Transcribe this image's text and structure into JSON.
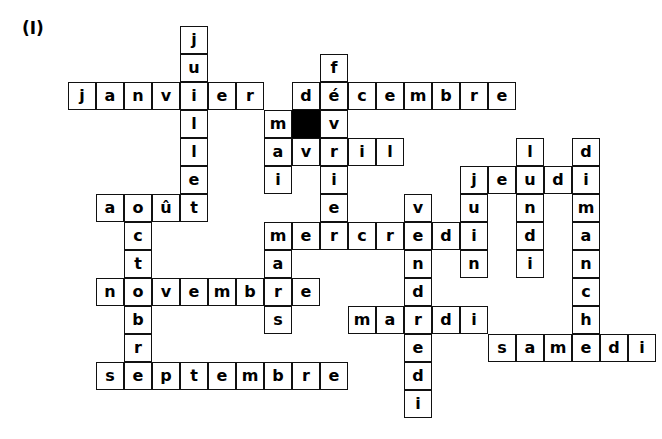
{
  "figure": {
    "label": "(I)"
  },
  "grid": {
    "cell_size": 28,
    "origin_x": 68,
    "origin_y": 26,
    "border_color": "#111111",
    "cell_fill": "#ffffff",
    "blocked_fill": "#000000",
    "text_color": "#000000",
    "columns": 20,
    "rows": 14
  },
  "entries": [
    {
      "word": "juillet",
      "direction": "down",
      "col": 4,
      "row": 0
    },
    {
      "word": "janvier",
      "direction": "across",
      "col": 0,
      "row": 2
    },
    {
      "word": "fevrier",
      "direction": "down",
      "col": 9,
      "row": 1
    },
    {
      "word": "decembre",
      "direction": "across",
      "col": 8,
      "row": 2
    },
    {
      "word": "mai",
      "direction": "down",
      "col": 7,
      "row": 3
    },
    {
      "word": "avril",
      "direction": "across",
      "col": 7,
      "row": 4
    },
    {
      "word": "aout",
      "direction": "across",
      "col": 1,
      "row": 6
    },
    {
      "word": "octobre",
      "direction": "down",
      "col": 2,
      "row": 6
    },
    {
      "word": "lundi",
      "direction": "down",
      "col": 16,
      "row": 4
    },
    {
      "word": "dimanche",
      "direction": "down",
      "col": 18,
      "row": 4
    },
    {
      "word": "jeudi",
      "direction": "across",
      "col": 14,
      "row": 5
    },
    {
      "word": "juin",
      "direction": "down",
      "col": 14,
      "row": 5
    },
    {
      "word": "vendredi",
      "direction": "down",
      "col": 12,
      "row": 6
    },
    {
      "word": "mercredi",
      "direction": "across",
      "col": 7,
      "row": 8
    },
    {
      "word": "mars",
      "direction": "down",
      "col": 7,
      "row": 8
    },
    {
      "word": "novembre",
      "direction": "across",
      "col": 1,
      "row": 10
    },
    {
      "word": "mardi",
      "direction": "across",
      "col": 10,
      "row": 10
    },
    {
      "word": "samedi",
      "direction": "across",
      "col": 15,
      "row": 11
    },
    {
      "word": "septembre",
      "direction": "across",
      "col": 1,
      "row": 13
    }
  ],
  "cells": [
    {
      "col": 4,
      "row": 0,
      "letter": "j",
      "blocked": false
    },
    {
      "col": 4,
      "row": 1,
      "letter": "u",
      "blocked": false
    },
    {
      "col": 9,
      "row": 1,
      "letter": "f",
      "blocked": false
    },
    {
      "col": 0,
      "row": 2,
      "letter": "j",
      "blocked": false
    },
    {
      "col": 1,
      "row": 2,
      "letter": "a",
      "blocked": false
    },
    {
      "col": 2,
      "row": 2,
      "letter": "n",
      "blocked": false
    },
    {
      "col": 3,
      "row": 2,
      "letter": "v",
      "blocked": false
    },
    {
      "col": 4,
      "row": 2,
      "letter": "i",
      "blocked": false
    },
    {
      "col": 5,
      "row": 2,
      "letter": "e",
      "blocked": false
    },
    {
      "col": 6,
      "row": 2,
      "letter": "r",
      "blocked": false
    },
    {
      "col": 8,
      "row": 2,
      "letter": "d",
      "blocked": false
    },
    {
      "col": 9,
      "row": 2,
      "letter": "é",
      "blocked": false
    },
    {
      "col": 10,
      "row": 2,
      "letter": "c",
      "blocked": false
    },
    {
      "col": 11,
      "row": 2,
      "letter": "e",
      "blocked": false
    },
    {
      "col": 12,
      "row": 2,
      "letter": "m",
      "blocked": false
    },
    {
      "col": 13,
      "row": 2,
      "letter": "b",
      "blocked": false
    },
    {
      "col": 14,
      "row": 2,
      "letter": "r",
      "blocked": false
    },
    {
      "col": 15,
      "row": 2,
      "letter": "e",
      "blocked": false
    },
    {
      "col": 4,
      "row": 3,
      "letter": "l",
      "blocked": false
    },
    {
      "col": 7,
      "row": 3,
      "letter": "m",
      "blocked": false
    },
    {
      "col": 8,
      "row": 3,
      "letter": "",
      "blocked": true
    },
    {
      "col": 9,
      "row": 3,
      "letter": "v",
      "blocked": false
    },
    {
      "col": 4,
      "row": 4,
      "letter": "l",
      "blocked": false
    },
    {
      "col": 7,
      "row": 4,
      "letter": "a",
      "blocked": false
    },
    {
      "col": 8,
      "row": 4,
      "letter": "v",
      "blocked": false
    },
    {
      "col": 9,
      "row": 4,
      "letter": "r",
      "blocked": false
    },
    {
      "col": 10,
      "row": 4,
      "letter": "i",
      "blocked": false
    },
    {
      "col": 11,
      "row": 4,
      "letter": "l",
      "blocked": false
    },
    {
      "col": 16,
      "row": 4,
      "letter": "l",
      "blocked": false
    },
    {
      "col": 18,
      "row": 4,
      "letter": "d",
      "blocked": false
    },
    {
      "col": 4,
      "row": 5,
      "letter": "e",
      "blocked": false
    },
    {
      "col": 7,
      "row": 5,
      "letter": "i",
      "blocked": false
    },
    {
      "col": 9,
      "row": 5,
      "letter": "i",
      "blocked": false
    },
    {
      "col": 14,
      "row": 5,
      "letter": "j",
      "blocked": false
    },
    {
      "col": 15,
      "row": 5,
      "letter": "e",
      "blocked": false
    },
    {
      "col": 16,
      "row": 5,
      "letter": "u",
      "blocked": false
    },
    {
      "col": 17,
      "row": 5,
      "letter": "d",
      "blocked": false
    },
    {
      "col": 18,
      "row": 5,
      "letter": "i",
      "blocked": false
    },
    {
      "col": 1,
      "row": 6,
      "letter": "a",
      "blocked": false
    },
    {
      "col": 2,
      "row": 6,
      "letter": "o",
      "blocked": false
    },
    {
      "col": 3,
      "row": 6,
      "letter": "û",
      "blocked": false
    },
    {
      "col": 4,
      "row": 6,
      "letter": "t",
      "blocked": false
    },
    {
      "col": 9,
      "row": 6,
      "letter": "e",
      "blocked": false
    },
    {
      "col": 12,
      "row": 6,
      "letter": "v",
      "blocked": false
    },
    {
      "col": 14,
      "row": 6,
      "letter": "u",
      "blocked": false
    },
    {
      "col": 16,
      "row": 6,
      "letter": "n",
      "blocked": false
    },
    {
      "col": 18,
      "row": 6,
      "letter": "m",
      "blocked": false
    },
    {
      "col": 2,
      "row": 7,
      "letter": "c",
      "blocked": false
    },
    {
      "col": 7,
      "row": 7,
      "letter": "m",
      "blocked": false
    },
    {
      "col": 8,
      "row": 7,
      "letter": "e",
      "blocked": false
    },
    {
      "col": 9,
      "row": 7,
      "letter": "r",
      "blocked": false
    },
    {
      "col": 10,
      "row": 7,
      "letter": "c",
      "blocked": false
    },
    {
      "col": 11,
      "row": 7,
      "letter": "r",
      "blocked": false
    },
    {
      "col": 12,
      "row": 7,
      "letter": "e",
      "blocked": false
    },
    {
      "col": 13,
      "row": 7,
      "letter": "d",
      "blocked": false
    },
    {
      "col": 14,
      "row": 7,
      "letter": "i",
      "blocked": false
    },
    {
      "col": 16,
      "row": 7,
      "letter": "d",
      "blocked": false
    },
    {
      "col": 18,
      "row": 7,
      "letter": "a",
      "blocked": false
    },
    {
      "col": 2,
      "row": 8,
      "letter": "t",
      "blocked": false
    },
    {
      "col": 7,
      "row": 8,
      "letter": "a",
      "blocked": false
    },
    {
      "col": 12,
      "row": 8,
      "letter": "n",
      "blocked": false
    },
    {
      "col": 14,
      "row": 8,
      "letter": "n",
      "blocked": false
    },
    {
      "col": 16,
      "row": 8,
      "letter": "i",
      "blocked": false
    },
    {
      "col": 18,
      "row": 8,
      "letter": "n",
      "blocked": false
    },
    {
      "col": 1,
      "row": 9,
      "letter": "n",
      "blocked": false
    },
    {
      "col": 2,
      "row": 9,
      "letter": "o",
      "blocked": false
    },
    {
      "col": 3,
      "row": 9,
      "letter": "v",
      "blocked": false
    },
    {
      "col": 4,
      "row": 9,
      "letter": "e",
      "blocked": false
    },
    {
      "col": 5,
      "row": 9,
      "letter": "m",
      "blocked": false
    },
    {
      "col": 6,
      "row": 9,
      "letter": "b",
      "blocked": false
    },
    {
      "col": 7,
      "row": 9,
      "letter": "r",
      "blocked": false
    },
    {
      "col": 8,
      "row": 9,
      "letter": "e",
      "blocked": false
    },
    {
      "col": 12,
      "row": 9,
      "letter": "d",
      "blocked": false
    },
    {
      "col": 18,
      "row": 9,
      "letter": "c",
      "blocked": false
    },
    {
      "col": 2,
      "row": 10,
      "letter": "b",
      "blocked": false
    },
    {
      "col": 7,
      "row": 10,
      "letter": "s",
      "blocked": false
    },
    {
      "col": 10,
      "row": 10,
      "letter": "m",
      "blocked": false
    },
    {
      "col": 11,
      "row": 10,
      "letter": "a",
      "blocked": false
    },
    {
      "col": 12,
      "row": 10,
      "letter": "r",
      "blocked": false
    },
    {
      "col": 13,
      "row": 10,
      "letter": "d",
      "blocked": false
    },
    {
      "col": 14,
      "row": 10,
      "letter": "i",
      "blocked": false
    },
    {
      "col": 18,
      "row": 10,
      "letter": "h",
      "blocked": false
    },
    {
      "col": 2,
      "row": 11,
      "letter": "r",
      "blocked": false
    },
    {
      "col": 12,
      "row": 11,
      "letter": "e",
      "blocked": false
    },
    {
      "col": 15,
      "row": 11,
      "letter": "s",
      "blocked": false
    },
    {
      "col": 16,
      "row": 11,
      "letter": "a",
      "blocked": false
    },
    {
      "col": 17,
      "row": 11,
      "letter": "m",
      "blocked": false
    },
    {
      "col": 18,
      "row": 11,
      "letter": "e",
      "blocked": false
    },
    {
      "col": 19,
      "row": 11,
      "letter": "d",
      "blocked": false
    },
    {
      "col": 20,
      "row": 11,
      "letter": "i",
      "blocked": false
    },
    {
      "col": 1,
      "row": 12,
      "letter": "s",
      "blocked": false
    },
    {
      "col": 2,
      "row": 12,
      "letter": "e",
      "blocked": false
    },
    {
      "col": 3,
      "row": 12,
      "letter": "p",
      "blocked": false
    },
    {
      "col": 4,
      "row": 12,
      "letter": "t",
      "blocked": false
    },
    {
      "col": 5,
      "row": 12,
      "letter": "e",
      "blocked": false
    },
    {
      "col": 6,
      "row": 12,
      "letter": "m",
      "blocked": false
    },
    {
      "col": 7,
      "row": 12,
      "letter": "b",
      "blocked": false
    },
    {
      "col": 8,
      "row": 12,
      "letter": "r",
      "blocked": false
    },
    {
      "col": 9,
      "row": 12,
      "letter": "e",
      "blocked": false
    },
    {
      "col": 12,
      "row": 12,
      "letter": "d",
      "blocked": false
    },
    {
      "col": 12,
      "row": 13,
      "letter": "i",
      "blocked": false
    }
  ]
}
